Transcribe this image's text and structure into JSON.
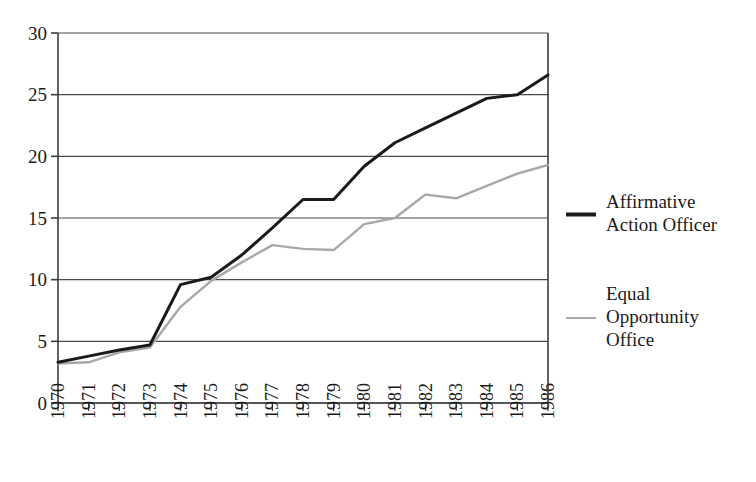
{
  "chart_data": {
    "type": "line",
    "title": "",
    "subtitle": "",
    "xlabel": "",
    "ylabel": "",
    "categories": [
      "1970",
      "1971",
      "1972",
      "1973",
      "1974",
      "1975",
      "1976",
      "1977",
      "1978",
      "1979",
      "1980",
      "1981",
      "1982",
      "1983",
      "1984",
      "1985",
      "1986"
    ],
    "xlim": [
      1970,
      1986
    ],
    "ylim": [
      0,
      30
    ],
    "yticks": [
      0,
      5,
      10,
      15,
      20,
      25,
      30
    ],
    "ytick_labels": [
      "0",
      "5",
      "10",
      "15",
      "20",
      "25",
      "30"
    ],
    "grid": "horizontal",
    "xtick_label_rotation": -90,
    "legend_position": "right",
    "series": [
      {
        "name": "Affirmative Action Officer",
        "color": "#1a1a1a",
        "line_width": 3,
        "values": [
          3.3,
          3.8,
          4.3,
          4.7,
          9.6,
          10.2,
          12.0,
          14.2,
          16.5,
          16.5,
          19.2,
          21.1,
          22.3,
          23.5,
          24.7,
          25.0,
          26.6
        ]
      },
      {
        "name": "Equal Opportunity Office",
        "color": "#a8a8a8",
        "line_width": 2.4,
        "values": [
          3.2,
          3.3,
          4.1,
          4.5,
          7.8,
          9.9,
          11.4,
          12.8,
          12.5,
          12.4,
          14.5,
          15.0,
          16.9,
          16.6,
          17.6,
          18.6,
          19.3
        ]
      }
    ],
    "legend": [
      {
        "label_lines": [
          "Affirmative",
          "Action Officer"
        ],
        "color": "#1a1a1a",
        "swatch": "thick-line"
      },
      {
        "label_lines": [
          "Equal",
          "Opportunity",
          "Office"
        ],
        "color": "#a8a8a8",
        "swatch": "thin-line"
      }
    ],
    "axis_color": "#3c3c3c",
    "grid_color": "#4a4a4a",
    "background": "#ffffff"
  }
}
